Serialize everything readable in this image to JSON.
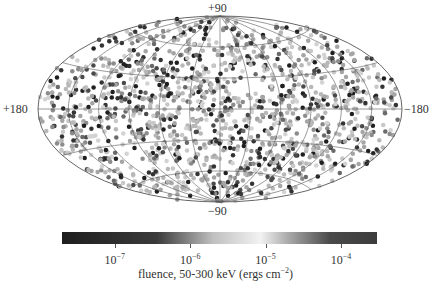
{
  "chart_data": {
    "type": "scatter",
    "projection": "aitoff (all-sky, galactic-style)",
    "title": "",
    "axis_labels": {
      "top": "+90",
      "bottom": "−90",
      "left": "+180",
      "right": "−180"
    },
    "grid": {
      "meridians_deg": [
        -180,
        -150,
        -120,
        -90,
        -60,
        -30,
        0,
        30,
        60,
        90,
        120,
        150,
        180
      ],
      "parallels_deg": [
        -60,
        -30,
        0,
        30,
        60
      ],
      "color": "#555555"
    },
    "points": {
      "count_approx": 1500,
      "distribution": "isotropic over the sky",
      "marker": "filled circle",
      "marker_diameter_px": 4.5,
      "color_encoding": "fluence (log scale, grayscale colormap)"
    },
    "colorbar": {
      "label": "fluence, 50-300 keV (ergs cm",
      "label_exp": "−2",
      "label_close": ")",
      "scale": "log",
      "range": [
        2e-08,
        0.0003
      ],
      "ticks": [
        {
          "base": "10",
          "exp": "−7",
          "value": 1e-07
        },
        {
          "base": "10",
          "exp": "−6",
          "value": 1e-06
        },
        {
          "base": "10",
          "exp": "−5",
          "value": 1e-05
        },
        {
          "base": "10",
          "exp": "−4",
          "value": 0.0001
        }
      ],
      "gradient_stops": [
        {
          "pos": 0.0,
          "color": "#1e1e1e"
        },
        {
          "pos": 0.3,
          "color": "#3a3a3a"
        },
        {
          "pos": 0.48,
          "color": "#c0c0c0"
        },
        {
          "pos": 0.63,
          "color": "#f2f2f2"
        },
        {
          "pos": 0.72,
          "color": "#a8a8a8"
        },
        {
          "pos": 0.85,
          "color": "#4a4a4a"
        },
        {
          "pos": 1.0,
          "color": "#3c3c3c"
        }
      ]
    }
  },
  "render": {
    "center_x": 220,
    "center_y": 109,
    "semi_major_px": 182,
    "semi_minor_px": 93,
    "seed": 12345,
    "dot_palette": [
      "#1f1f1f",
      "#333333",
      "#4a4a4a",
      "#6a6a6a",
      "#8c8c8c",
      "#a5a5a5",
      "#b8b8b8",
      "#c8c8c8",
      "#d3d3d3"
    ],
    "dot_palette_weights": [
      0.1,
      0.1,
      0.07,
      0.07,
      0.1,
      0.16,
      0.18,
      0.14,
      0.08
    ]
  }
}
